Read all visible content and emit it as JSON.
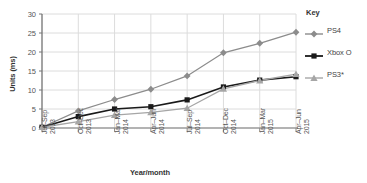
{
  "chart_data": {
    "type": "line",
    "title": "",
    "xlabel": "Year/month",
    "ylabel": "Units (ms)",
    "ylim": [
      0,
      30
    ],
    "yticks": [
      0,
      5,
      10,
      15,
      20,
      25,
      30
    ],
    "grid": true,
    "legend_position": "right",
    "legend_title": "Key",
    "categories": [
      "Jul–Sep 2013",
      "Oct–Dec 2013",
      "Jan–Mar 2014",
      "Apr–Jun 2014",
      "Jul–Sep 2014",
      "Oct–Dec 2014",
      "Jan–Mar 2015",
      "Apr–Jun 2015"
    ],
    "category_parts": [
      {
        "period": "Jul–Sep",
        "year": "2013"
      },
      {
        "period": "Oct–Dec",
        "year": "2013"
      },
      {
        "period": "Jan–Mar",
        "year": "2014"
      },
      {
        "period": "Apr–Jun",
        "year": "2014"
      },
      {
        "period": "Jul–Sep",
        "year": "2014"
      },
      {
        "period": "Oct–Dec",
        "year": "2014"
      },
      {
        "period": "Jan–Mar",
        "year": "2015"
      },
      {
        "period": "Apr–Jun",
        "year": "2015"
      }
    ],
    "series": [
      {
        "name": "PS4",
        "marker": "diamond",
        "color": "#8c8c8c",
        "values": [
          0.2,
          4.5,
          7.5,
          10.2,
          13.7,
          19.8,
          22.3,
          25.2
        ]
      },
      {
        "name": "Xbox O",
        "marker": "square",
        "color": "#1a1a1a",
        "values": [
          0.2,
          3.0,
          5.0,
          5.6,
          7.4,
          10.8,
          12.6,
          13.5
        ]
      },
      {
        "name": "PS3*",
        "marker": "triangle",
        "color": "#a6a6a6",
        "values": [
          0.2,
          1.7,
          3.4,
          4.1,
          5.2,
          10.3,
          12.5,
          14.2
        ]
      }
    ]
  },
  "colors": {
    "grid": "#dcdcdc",
    "axis": "#808080",
    "text": "#555555",
    "title_text": "#333333"
  }
}
